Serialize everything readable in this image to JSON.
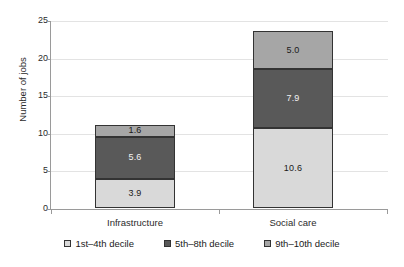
{
  "chart_data": {
    "type": "bar",
    "subtype": "stacked-bar",
    "title": "",
    "xlabel": "",
    "ylabel": "Number of jobs",
    "ylim": [
      0,
      25
    ],
    "yticks": [
      0,
      5,
      10,
      15,
      20,
      25
    ],
    "ytick_labels": [
      "0",
      "5",
      "10",
      "15",
      "20",
      "25"
    ],
    "grid": true,
    "grid_axis": "y",
    "legend_position": "bottom",
    "categories": [
      "Infrastructure",
      "Social care"
    ],
    "series": [
      {
        "name": "1st–4th decile",
        "color": "#d9d9d9",
        "values": [
          3.9,
          10.6
        ],
        "data_labels": [
          "3.9",
          "10.6"
        ]
      },
      {
        "name": "5th–8th decile",
        "color": "#595959",
        "values": [
          5.6,
          7.9
        ],
        "data_labels": [
          "5.6",
          "7.9"
        ]
      },
      {
        "name": "9th–10th decile",
        "color": "#a6a6a6",
        "values": [
          1.6,
          5.0
        ],
        "data_labels": [
          "1.6",
          "5.0"
        ]
      }
    ],
    "totals": [
      11.1,
      23.5
    ]
  },
  "axes": {
    "y_title": "Number of jobs",
    "y_ticks": [
      {
        "label": "25",
        "value": 25
      },
      {
        "label": "20",
        "value": 20
      },
      {
        "label": "15",
        "value": 15
      },
      {
        "label": "10",
        "value": 10
      },
      {
        "label": "5",
        "value": 5
      },
      {
        "label": "0",
        "value": 0
      }
    ],
    "x_categories": [
      {
        "label": "Infrastructure"
      },
      {
        "label": "Social care"
      }
    ]
  },
  "legend": {
    "items": [
      {
        "label": "1st–4th decile",
        "color": "#d9d9d9"
      },
      {
        "label": "5th–8th decile",
        "color": "#595959"
      },
      {
        "label": "9th–10th decile",
        "color": "#a6a6a6"
      }
    ]
  },
  "bars": [
    {
      "category": "Infrastructure",
      "segments": [
        {
          "series": "9th–10th decile",
          "label": "1.6",
          "value": 1.6,
          "color": "#a6a6a6",
          "dark": false
        },
        {
          "series": "5th–8th decile",
          "label": "5.6",
          "value": 5.6,
          "color": "#595959",
          "dark": true
        },
        {
          "series": "1st–4th decile",
          "label": "3.9",
          "value": 3.9,
          "color": "#d9d9d9",
          "dark": false
        }
      ]
    },
    {
      "category": "Social care",
      "segments": [
        {
          "series": "9th–10th decile",
          "label": "5.0",
          "value": 5.0,
          "color": "#a6a6a6",
          "dark": false
        },
        {
          "series": "5th–8th decile",
          "label": "7.9",
          "value": 7.9,
          "color": "#595959",
          "dark": true
        },
        {
          "series": "1st–4th decile",
          "label": "10.6",
          "value": 10.6,
          "color": "#d9d9d9",
          "dark": false
        }
      ]
    }
  ]
}
